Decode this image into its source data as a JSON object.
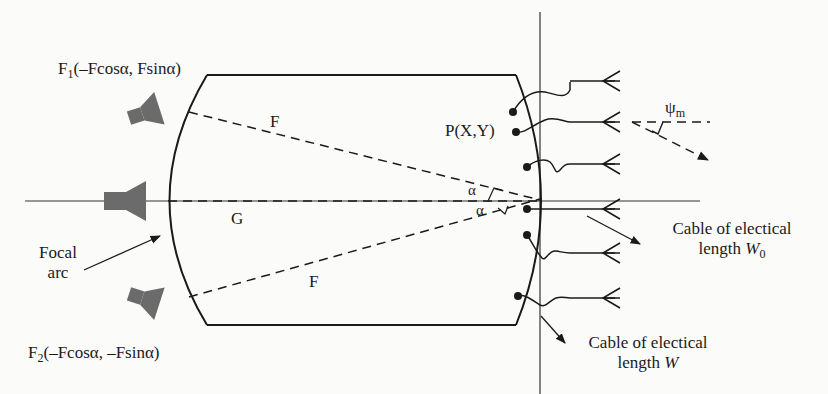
{
  "diagram": {
    "labels": {
      "f1": {
        "name": "F",
        "sub": "1",
        "coords": "(–Fcosα, Fsinα)"
      },
      "f2": {
        "name": "F",
        "sub": "2",
        "coords": "(–Fcosα, –Fsinα)"
      },
      "focal_arc": [
        "Focal",
        "arc"
      ],
      "upper_f": "F",
      "lower_f": "F",
      "g": "G",
      "point_p": "P(X,Y)",
      "alpha_upper": "α",
      "alpha_lower": "α",
      "psi": {
        "name": "ψ",
        "sub": "m"
      },
      "cable_w0": {
        "line1": "Cable of electical",
        "line2": "length ",
        "var": "W",
        "sub": "0"
      },
      "cable_w": {
        "line1": "Cable of electical",
        "line2": "length ",
        "var": "W"
      }
    },
    "colors": {
      "stroke": "#1a1a1a",
      "horn": "#6b6b6b",
      "background": "#fbfbfa"
    }
  }
}
